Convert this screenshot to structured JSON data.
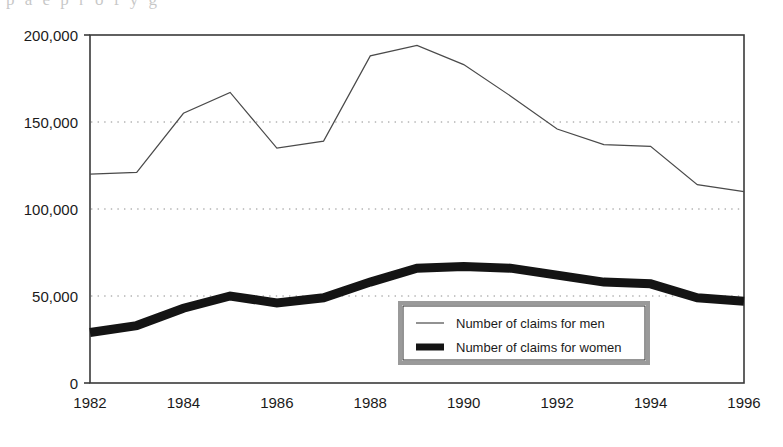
{
  "figure": {
    "caption_fragment": "p   a   e   p  r   o  f  y  g",
    "plot_area": {
      "left": 90,
      "top": 35,
      "right": 744,
      "bottom": 383
    }
  },
  "chart_data": {
    "type": "line",
    "title": "",
    "xlabel": "",
    "ylabel": "",
    "x": [
      1982,
      1983,
      1984,
      1985,
      1986,
      1987,
      1988,
      1989,
      1990,
      1991,
      1992,
      1993,
      1994,
      1995,
      1996
    ],
    "xlim": [
      1982,
      1996
    ],
    "ylim": [
      0,
      200000
    ],
    "xticks": [
      1982,
      1984,
      1986,
      1988,
      1990,
      1992,
      1994,
      1996
    ],
    "xtick_labels": [
      "1982",
      "1984",
      "1986",
      "1988",
      "1990",
      "1992",
      "1994",
      "1996"
    ],
    "yticks": [
      0,
      50000,
      100000,
      150000,
      200000
    ],
    "ytick_labels": [
      "0",
      "50,000",
      "100,000",
      "150,000",
      "200,000"
    ],
    "grid": "horizontal-dotted",
    "gridlines": [
      50000,
      100000,
      150000
    ],
    "legend_position": "lower-center-right",
    "series": [
      {
        "name": "Number of claims for men",
        "style": "thin",
        "color": "#4a4a4a",
        "linewidth": 1.2,
        "values": [
          120000,
          121000,
          155000,
          167000,
          135000,
          139000,
          188000,
          194000,
          183000,
          165000,
          146000,
          137000,
          136000,
          114000,
          110000
        ]
      },
      {
        "name": "Number of claims for women",
        "style": "thick",
        "color": "#141414",
        "linewidth": 9,
        "values": [
          29000,
          33000,
          43000,
          50000,
          46000,
          49000,
          58000,
          66000,
          67000,
          66000,
          62000,
          58000,
          57000,
          49000,
          47000
        ]
      }
    ]
  },
  "legend": {
    "box_color": "#9a9a9a",
    "background": "#ffffff",
    "items": [
      {
        "label": "Number of claims for men",
        "swatch": "thin-line-swatch"
      },
      {
        "label": "Number of claims for women",
        "swatch": "thick-line-swatch"
      }
    ]
  },
  "colors": {
    "axis": "#3a3a3a",
    "grid": "#8c8c8c",
    "men_line": "#4a4a4a",
    "women_line": "#141414",
    "legend_border": "#9a9a9a",
    "text": "#1b1b1b",
    "background": "#ffffff"
  }
}
